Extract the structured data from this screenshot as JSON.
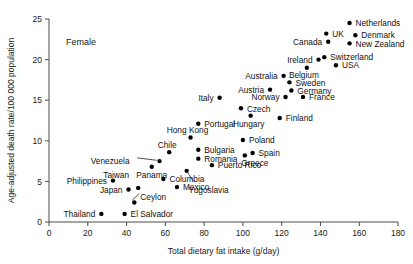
{
  "chart_data": {
    "type": "scatter",
    "title": "",
    "panel_label": "Female",
    "xlabel": "Total dietary fat intake (g/day)",
    "ylabel": "Age-adjusted death rate/100 000 population",
    "xlim": [
      0,
      180
    ],
    "ylim": [
      0,
      25
    ],
    "xticks": [
      0,
      20,
      40,
      60,
      80,
      100,
      120,
      140,
      160,
      180
    ],
    "yticks": [
      0,
      5,
      10,
      15,
      20,
      25
    ],
    "grid": false,
    "legend": "none",
    "points": [
      {
        "label": "Netherlands",
        "x": 155,
        "y": 24.5,
        "lx": 6,
        "ly": 3.2,
        "anchor": "start"
      },
      {
        "label": "Denmark",
        "x": 158,
        "y": 23.0,
        "lx": 6,
        "ly": 3.2,
        "anchor": "start"
      },
      {
        "label": "UK",
        "x": 143,
        "y": 23.2,
        "lx": 6,
        "ly": 3.2,
        "anchor": "start"
      },
      {
        "label": "New Zealand",
        "x": 155,
        "y": 22.0,
        "lx": 6,
        "ly": 3.2,
        "anchor": "start"
      },
      {
        "label": "Canada",
        "x": 144,
        "y": 22.2,
        "lx": -6,
        "ly": 3.2,
        "anchor": "end"
      },
      {
        "label": "Switzerland",
        "x": 142,
        "y": 20.3,
        "lx": 6,
        "ly": 3.2,
        "anchor": "start"
      },
      {
        "label": "Ireland",
        "x": 139,
        "y": 20.0,
        "lx": -6,
        "ly": 3.2,
        "anchor": "end"
      },
      {
        "label": "USA",
        "x": 148,
        "y": 19.3,
        "lx": 6,
        "ly": 3.2,
        "anchor": "start"
      },
      {
        "label": "Belgium",
        "x": 133,
        "y": 19.0,
        "lx": -3,
        "ly": 10.5,
        "anchor": "middle"
      },
      {
        "label": "Australia",
        "x": 121,
        "y": 18.0,
        "lx": -6,
        "ly": 3.2,
        "anchor": "end"
      },
      {
        "label": "Sweden",
        "x": 124,
        "y": 17.2,
        "lx": 6,
        "ly": 3.2,
        "anchor": "start"
      },
      {
        "label": "Germany",
        "x": 125,
        "y": 16.2,
        "lx": 6,
        "ly": 3.2,
        "anchor": "start"
      },
      {
        "label": "Austria",
        "x": 114,
        "y": 16.3,
        "lx": -6,
        "ly": 3.2,
        "anchor": "end"
      },
      {
        "label": "France",
        "x": 131,
        "y": 15.4,
        "lx": 6,
        "ly": 3.2,
        "anchor": "start"
      },
      {
        "label": "Norway",
        "x": 122,
        "y": 15.4,
        "lx": -6,
        "ly": 3.2,
        "anchor": "end"
      },
      {
        "label": "Italy",
        "x": 88,
        "y": 15.3,
        "lx": -6,
        "ly": 3.2,
        "anchor": "end"
      },
      {
        "label": "Czech",
        "x": 99,
        "y": 14.0,
        "lx": 6,
        "ly": 3.2,
        "anchor": "start"
      },
      {
        "label": "Hungary",
        "x": 104,
        "y": 13.1,
        "lx": -2,
        "ly": 11.0,
        "anchor": "middle"
      },
      {
        "label": "Finland",
        "x": 119,
        "y": 12.8,
        "lx": 6,
        "ly": 3.2,
        "anchor": "start"
      },
      {
        "label": "Portugal",
        "x": 77,
        "y": 12.1,
        "lx": 6,
        "ly": 3.2,
        "anchor": "start"
      },
      {
        "label": "Hong Kong",
        "x": 73,
        "y": 10.4,
        "lx": -3,
        "ly": -4.5,
        "anchor": "middle"
      },
      {
        "label": "Poland",
        "x": 100,
        "y": 10.1,
        "lx": 6,
        "ly": 3.2,
        "anchor": "start"
      },
      {
        "label": "Bulgaria",
        "x": 77,
        "y": 8.9,
        "lx": 6,
        "ly": 3.2,
        "anchor": "start"
      },
      {
        "label": "Chile",
        "x": 62,
        "y": 8.6,
        "lx": -2,
        "ly": -4.5,
        "anchor": "middle"
      },
      {
        "label": "Spain",
        "x": 105,
        "y": 8.5,
        "lx": 6,
        "ly": 3.2,
        "anchor": "start"
      },
      {
        "label": "Greece",
        "x": 101,
        "y": 8.2,
        "lx": 10,
        "ly": 10.5,
        "anchor": "middle"
      },
      {
        "label": "Romania",
        "x": 77,
        "y": 7.8,
        "lx": 6,
        "ly": 3.2,
        "anchor": "start"
      },
      {
        "label": "Puerto Rico",
        "x": 84,
        "y": 7.0,
        "lx": 6,
        "ly": 3.2,
        "anchor": "start"
      },
      {
        "label": "Venezuela",
        "x": 57,
        "y": 7.5,
        "lx": -30,
        "ly": 3.2,
        "anchor": "end"
      },
      {
        "label": "Panama",
        "x": 53,
        "y": 6.8,
        "lx": 0,
        "ly": 11.0,
        "anchor": "middle"
      },
      {
        "label": "Yugoslavia",
        "x": 71,
        "y": 6.3,
        "lx": 22,
        "ly": 22.0,
        "anchor": "middle"
      },
      {
        "label": "Columbia",
        "x": 59,
        "y": 5.3,
        "lx": 6,
        "ly": 3.2,
        "anchor": "start"
      },
      {
        "label": "Philippines",
        "x": 33,
        "y": 5.1,
        "lx": -6,
        "ly": 3.2,
        "anchor": "end"
      },
      {
        "label": "Taiwan",
        "x": 46,
        "y": 4.2,
        "lx": -22,
        "ly": -10.0,
        "anchor": "middle"
      },
      {
        "label": "Mexico",
        "x": 66,
        "y": 4.3,
        "lx": 6,
        "ly": 3.2,
        "anchor": "start"
      },
      {
        "label": "Japan",
        "x": 41,
        "y": 4.0,
        "lx": -6,
        "ly": 3.2,
        "anchor": "end"
      },
      {
        "label": "Ceylon",
        "x": 44,
        "y": 2.4,
        "lx": 6,
        "ly": -3.0,
        "anchor": "start"
      },
      {
        "label": "Thailand",
        "x": 27,
        "y": 1.0,
        "lx": -6,
        "ly": 3.2,
        "anchor": "end"
      },
      {
        "label": "El Salvador",
        "x": 39,
        "y": 1.0,
        "lx": 6,
        "ly": 3.2,
        "anchor": "start"
      }
    ],
    "leaders": [
      {
        "from_label": "Venezuela",
        "x1": 45.5,
        "y1": 7.9,
        "x2": 55.5,
        "y2": 7.6
      },
      {
        "from_label": "Taiwan",
        "x1": 46.5,
        "y1": 3.5,
        "x2": 43.0,
        "y2": 2.7
      },
      {
        "from_label": "Yugoslavia",
        "x1": 74.5,
        "y1": 5.0,
        "x2": 71.5,
        "y2": 6.1
      }
    ]
  }
}
